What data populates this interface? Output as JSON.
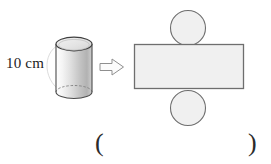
{
  "figure": {
    "background_color": "#ffffff"
  },
  "cylinder": {
    "name": "cylinder-3d",
    "dimension_label": "10 cm",
    "label_text_color": "#1c1c1c",
    "body_fill_start": "#ffffff",
    "body_fill_end": "#b9b9b9",
    "top_face_fill": "#e9e9e9",
    "outline_color": "#4a4a4a",
    "hidden_edge_style": "dashed",
    "leader_line_color": "#d9d9d9"
  },
  "arrow": {
    "name": "transform-arrow-icon",
    "direction": "right",
    "glyph": "⇨",
    "outline_color": "#8a8a8a",
    "fill_color": "#fafafa"
  },
  "net": {
    "name": "cylinder-net",
    "lateral_surface": {
      "name": "net-rectangle",
      "shape": "rectangle",
      "fill": "#f0f0f0",
      "stroke": "#6e6e6e"
    },
    "top_base": {
      "name": "net-circle-top",
      "shape": "circle",
      "fill": "#f0f0f0",
      "stroke": "#6e6e6e"
    },
    "bottom_base": {
      "name": "net-circle-bottom",
      "shape": "circle",
      "fill": "#f0f0f0",
      "stroke": "#6e6e6e"
    }
  },
  "answer_blank": {
    "open_paren": "(",
    "close_paren": ")",
    "value": "",
    "text_color": "#2b2b2b"
  }
}
